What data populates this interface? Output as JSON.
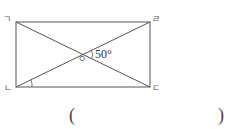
{
  "figure": {
    "shape": "rectangle with diagonals",
    "vertices": {
      "top_left": "ㄱ",
      "top_right": "ㄹ",
      "bottom_left": "ㄴ",
      "bottom_right": "ㄷ"
    },
    "intersection_label": "ㅇ",
    "angle_label": "50°",
    "marked_angle": "angle at ㄴ between diagonal ㄴㄹ and side ㄴㄷ"
  },
  "answer": {
    "open_paren": "(",
    "close_paren": ")",
    "value": ""
  }
}
